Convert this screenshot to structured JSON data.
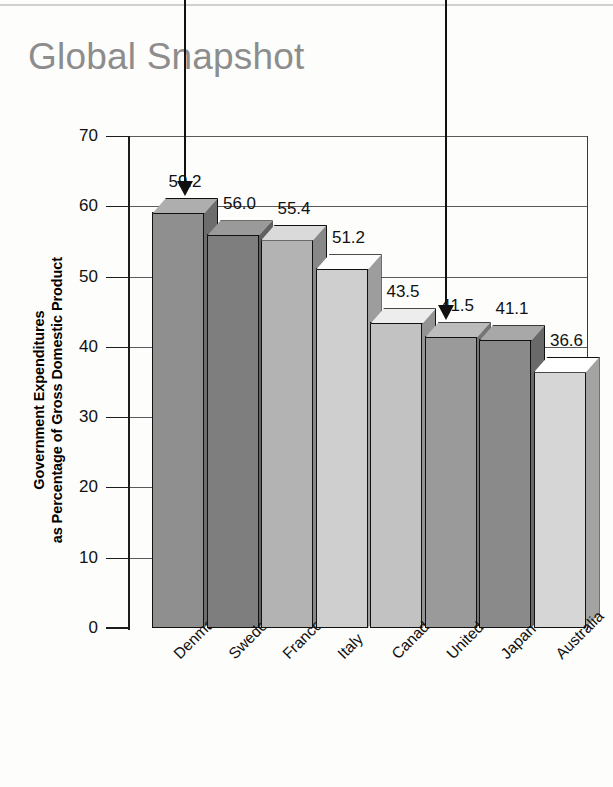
{
  "title": "Global Snapshot",
  "chart_data": {
    "type": "bar",
    "title": "Global Snapshot",
    "xlabel": "",
    "ylabel": "Government Expenditures as Percentage of Gross Domestic Product",
    "ylabel_lines": [
      "Government Expenditures",
      "as Percentage of Gross Domestic Product"
    ],
    "categories": [
      "Denmark",
      "Sweden",
      "France",
      "Italy",
      "Canada",
      "United States",
      "Japan",
      "Australia"
    ],
    "values": [
      59.2,
      56.0,
      55.4,
      51.2,
      43.5,
      41.5,
      41.1,
      36.6
    ],
    "value_labels": [
      "59.2",
      "56.0",
      "55.4",
      "51.2",
      "43.5",
      "41.5",
      "41.1",
      "36.6"
    ],
    "ylim": [
      0,
      70
    ],
    "ytick_labels": [
      "70",
      "60",
      "50",
      "40",
      "30",
      "20",
      "10",
      "0"
    ],
    "ytick_values": [
      70,
      60,
      50,
      40,
      30,
      20,
      10,
      0
    ],
    "grid": true,
    "legend": null,
    "bar_colors": [
      "#8f8f8f",
      "#7e7e7e",
      "#b3b3b3",
      "#cfcfcf",
      "#c2c2c2",
      "#9a9a9a",
      "#8a8a8a",
      "#d6d6d6"
    ],
    "annotations": [
      {
        "name": "arrow-denmark",
        "target": "Denmark",
        "value": 59.2
      },
      {
        "name": "arrow-united-states",
        "target": "United States",
        "value": 41.5
      }
    ]
  },
  "colors": {
    "title": "#8d8d8d",
    "axis": "#1c1c1c",
    "grid": "#5a5a5a",
    "text": "#111111",
    "arrow": "#111111",
    "background": "#fdfdfc"
  }
}
